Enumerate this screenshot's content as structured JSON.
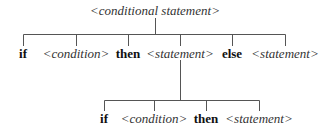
{
  "diagram": {
    "root": {
      "label": "<conditional statement>"
    },
    "level1": [
      {
        "label": "if",
        "type": "keyword"
      },
      {
        "label": "<condition>",
        "type": "nonterminal"
      },
      {
        "label": "then",
        "type": "keyword"
      },
      {
        "label": "<statement>",
        "type": "nonterminal"
      },
      {
        "label": "else",
        "type": "keyword"
      },
      {
        "label": "<statement>",
        "type": "nonterminal"
      }
    ],
    "level2_parent_index": 3,
    "level2": [
      {
        "label": "if",
        "type": "keyword"
      },
      {
        "label": "<condition>",
        "type": "nonterminal"
      },
      {
        "label": "then",
        "type": "keyword"
      },
      {
        "label": "<statement>",
        "type": "nonterminal"
      }
    ],
    "line_color": "#555555"
  }
}
